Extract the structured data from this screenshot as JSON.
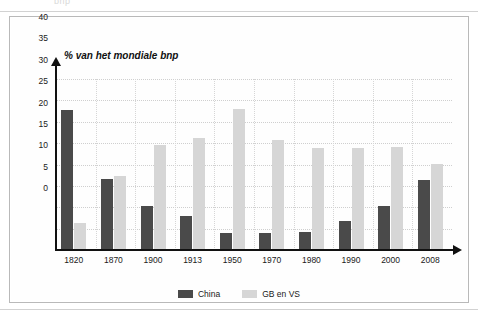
{
  "top_fragment": "bnp",
  "chart_data": {
    "type": "bar",
    "title": "% van het mondiale bnp",
    "xlabel": "",
    "ylabel": "",
    "ylim": [
      0,
      40
    ],
    "ytick_step": 5,
    "yticks": [
      40,
      35,
      30,
      25,
      20,
      15,
      10,
      5,
      0
    ],
    "grid": true,
    "legend_position": "bottom-center",
    "categories": [
      "1820",
      "1870",
      "1900",
      "1913",
      "1950",
      "1970",
      "1980",
      "1990",
      "2000",
      "2008"
    ],
    "series": [
      {
        "name": "China",
        "color": "#4a4a4a",
        "values": [
          32.7,
          16.7,
          10.3,
          8.0,
          3.9,
          3.9,
          4.3,
          6.8,
          10.4,
          16.4
        ]
      },
      {
        "name": "GB en VS",
        "color": "#d6d6d6",
        "values": [
          6.4,
          17.3,
          24.6,
          26.2,
          33.0,
          25.7,
          23.8,
          23.8,
          24.1,
          20.1
        ]
      }
    ]
  },
  "legend": {
    "items": [
      {
        "label": "China",
        "color": "#4a4a4a"
      },
      {
        "label": "GB en VS",
        "color": "#d6d6d6"
      }
    ]
  }
}
